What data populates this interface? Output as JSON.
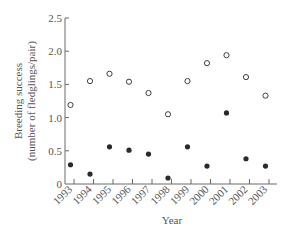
{
  "chart_data": {
    "type": "scatter",
    "title": "",
    "xlabel": "Year",
    "ylabel_line1": "Breeding success",
    "ylabel_line2": "(number of fledglings/pair)",
    "ylim": [
      0,
      2.5
    ],
    "yticks": [
      "0",
      "0.5",
      "1.0",
      "1.5",
      "2.0",
      "2.5"
    ],
    "ytick_values": [
      0,
      0.5,
      1.0,
      1.5,
      2.0,
      2.5
    ],
    "categories": [
      "1993",
      "1994",
      "1995",
      "1996",
      "1997",
      "1998",
      "1999",
      "2000",
      "2001",
      "2002",
      "2003"
    ],
    "grid": false,
    "legend": "none",
    "series": [
      {
        "name": "open circles",
        "marker": "open-circle",
        "values": [
          1.19,
          1.55,
          1.66,
          1.54,
          1.37,
          1.05,
          1.55,
          1.82,
          1.94,
          1.61,
          1.33
        ]
      },
      {
        "name": "filled circles",
        "marker": "filled-circle",
        "values": [
          0.29,
          0.15,
          0.56,
          0.51,
          0.45,
          0.09,
          0.56,
          0.27,
          1.07,
          0.38,
          0.27
        ]
      }
    ]
  },
  "colors": {
    "axis": "#6a6a6a",
    "marker": "#2a2a2a",
    "text": "#555555"
  }
}
